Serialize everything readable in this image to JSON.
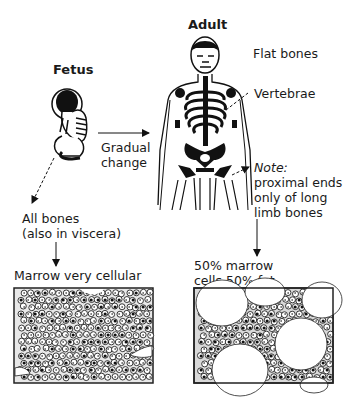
{
  "diagram": {
    "stages": {
      "fetus": {
        "title": "Fetus"
      },
      "adult": {
        "title": "Adult"
      }
    },
    "transition": {
      "line1": "Gradual",
      "line2": "change"
    },
    "adult_labels": {
      "flat_bones": "Flat bones",
      "vertebrae": "Vertebrae",
      "note_title": "Note:",
      "note_line1": "proximal ends",
      "note_line2": "only of long",
      "note_line3": "limb bones"
    },
    "fetus_labels": {
      "all_bones": "All bones",
      "also_viscera": "(also in viscera)"
    },
    "marrow": {
      "fetus_caption": "Marrow very cellular",
      "adult_caption_line1": "50% marrow",
      "adult_caption_line2": "cells 50% fat"
    }
  }
}
